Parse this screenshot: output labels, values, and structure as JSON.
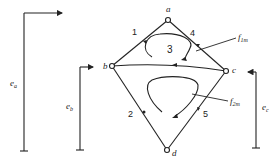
{
  "nodes": {
    "a": {
      "label": "a"
    },
    "b": {
      "label": "b"
    },
    "c": {
      "label": "c"
    },
    "d": {
      "label": "d"
    }
  },
  "edges": [
    {
      "id": "1",
      "label": "1",
      "from": "b",
      "to": "a"
    },
    {
      "id": "4",
      "label": "4",
      "from": "a",
      "to": "c"
    },
    {
      "id": "3",
      "label": "3",
      "from": "c",
      "to": "b"
    },
    {
      "id": "2",
      "label": "2",
      "from": "d",
      "to": "b"
    },
    {
      "id": "5",
      "label": "5",
      "from": "d",
      "to": "c"
    }
  ],
  "loops": {
    "f1m": {
      "main": "f",
      "sub": "1m"
    },
    "f2m": {
      "main": "f",
      "sub": "2m"
    }
  },
  "sources": {
    "ea": {
      "main": "e",
      "sub": "a"
    },
    "eb": {
      "main": "e",
      "sub": "b"
    },
    "ec": {
      "main": "e",
      "sub": "c"
    }
  },
  "colors": {
    "line": "#222222",
    "background": "#ffffff"
  }
}
